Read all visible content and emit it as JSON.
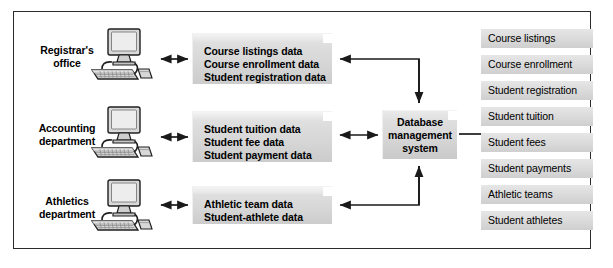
{
  "figure": {
    "border_color": "#2b2b2b",
    "background": "#ffffff"
  },
  "departments": [
    {
      "name": "registrars-office",
      "line1": "Registrar's",
      "line2": "office",
      "computer_icon": "desktop-computer-icon"
    },
    {
      "name": "accounting-department",
      "line1": "Accounting",
      "line2": "department",
      "computer_icon": "desktop-computer-icon"
    },
    {
      "name": "athletics-department",
      "line1": "Athletics",
      "line2": "department",
      "computer_icon": "desktop-computer-icon"
    }
  ],
  "data_boxes": [
    {
      "name": "registrar-data-box",
      "lines": [
        "Course listings data",
        "Course enrollment data",
        "Student registration data"
      ]
    },
    {
      "name": "accounting-data-box",
      "lines": [
        "Student tuition data",
        "Student fee data",
        "Student payment data"
      ]
    },
    {
      "name": "athletics-data-box",
      "lines": [
        "Athletic team data",
        "Student-athlete data"
      ]
    }
  ],
  "dbms": {
    "name": "database-management-system",
    "line1": "Database",
    "line2": "management",
    "line3": "system"
  },
  "database_files": [
    "Course listings",
    "Course enrollment",
    "Student registration",
    "Student tuition",
    "Student fees",
    "Student payments",
    "Athletic teams",
    "Student athletes"
  ],
  "connectors": {
    "computer_to_box": "double-headed-arrow",
    "top_box_to_dbms": "elbow-arrow-left-and-down",
    "middle_box_to_dbms": "double-headed-arrow",
    "bottom_box_to_dbms": "elbow-arrow-left-and-up",
    "dbms_to_files": "plain-line"
  },
  "colors": {
    "box_fill": "#d8d8d8",
    "list_fill": "#dcdcdc",
    "line": "#1a1a1a",
    "text": "#000000"
  }
}
